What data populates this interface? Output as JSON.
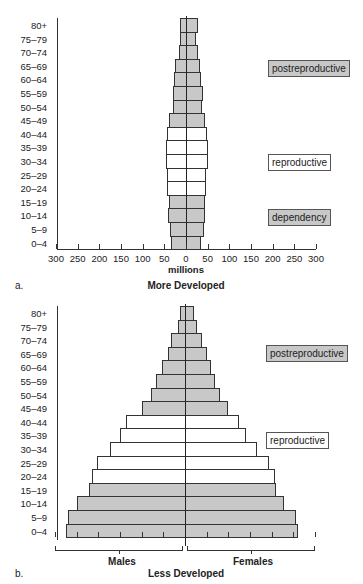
{
  "chart_data": [
    {
      "type": "bar",
      "subtype": "population-pyramid",
      "panel": "a.",
      "title": "More Developed",
      "xlabel": "millions",
      "ylabel": "",
      "xlim": [
        -300,
        300
      ],
      "x_tick_labels": [
        "300",
        "250",
        "200",
        "150",
        "100",
        "50",
        "0",
        "50",
        "100",
        "150",
        "200",
        "250",
        "300"
      ],
      "categories": [
        "80+",
        "75–79",
        "70–74",
        "65–69",
        "60–64",
        "55–59",
        "50–54",
        "45–49",
        "40–44",
        "35–39",
        "30–34",
        "25–29",
        "20–24",
        "15–19",
        "10–14",
        "5–9",
        "0–4"
      ],
      "series": [
        {
          "name": "Males",
          "side": "left",
          "values": [
            14,
            14,
            16,
            25,
            28,
            30,
            30,
            39,
            44,
            46,
            46,
            44,
            44,
            39,
            41,
            37,
            35
          ]
        },
        {
          "name": "Females",
          "side": "right",
          "values": [
            25,
            21,
            25,
            30,
            32,
            37,
            35,
            42,
            46,
            48,
            48,
            44,
            44,
            42,
            42,
            39,
            32
          ]
        }
      ],
      "group_shading": {
        "postreproductive": "gray",
        "reproductive": "white",
        "dependency": "gray"
      },
      "legend": [
        "postreproductive",
        "reproductive",
        "dependency"
      ],
      "legend_position": "right",
      "grid": false
    },
    {
      "type": "bar",
      "subtype": "population-pyramid",
      "panel": "b.",
      "title": "Less Developed",
      "xlabel_left": "Males",
      "xlabel_right": "Females",
      "xlim": [
        -300,
        300
      ],
      "categories": [
        "80+",
        "75–79",
        "70–74",
        "65–69",
        "60–64",
        "55–59",
        "50–54",
        "45–49",
        "40–44",
        "35–39",
        "30–34",
        "25–29",
        "20–24",
        "15–19",
        "10–14",
        "5–9",
        "0–4"
      ],
      "series": [
        {
          "name": "Males",
          "side": "left",
          "values": [
            12,
            16,
            32,
            39,
            53,
            67,
            78,
            99,
            136,
            150,
            173,
            203,
            215,
            222,
            249,
            270,
            275
          ]
        },
        {
          "name": "Females",
          "side": "right",
          "values": [
            18,
            25,
            37,
            48,
            58,
            67,
            78,
            97,
            122,
            138,
            164,
            192,
            205,
            208,
            226,
            254,
            258
          ]
        }
      ],
      "legend": [
        "postreproductive",
        "reproductive"
      ],
      "legend_position": "right",
      "grid": false
    }
  ],
  "age_groups": [
    "80+",
    "75–79",
    "70–74",
    "65–69",
    "60–64",
    "55–59",
    "50–54",
    "45–49",
    "40–44",
    "35–39",
    "30–34",
    "25–29",
    "20–24",
    "15–19",
    "10–14",
    "5–9",
    "0–4"
  ],
  "shading_by_age": [
    "gray",
    "gray",
    "gray",
    "gray",
    "gray",
    "gray",
    "gray",
    "gray",
    "white",
    "white",
    "white",
    "white",
    "white",
    "gray",
    "gray",
    "gray",
    "gray"
  ],
  "panel_a": {
    "letter": "a.",
    "title": "More Developed",
    "unit": "millions",
    "tick_labels": [
      "300",
      "250",
      "200",
      "150",
      "100",
      "50",
      "0",
      "50",
      "100",
      "150",
      "200",
      "250",
      "300"
    ],
    "legend": {
      "postreproductive": "postreproductive",
      "reproductive": "reproductive",
      "dependency": "dependency"
    }
  },
  "panel_b": {
    "letter": "b.",
    "title": "Less Developed",
    "males": "Males",
    "females": "Females",
    "legend": {
      "postreproductive": "postreproductive",
      "reproductive": "reproductive"
    }
  },
  "colors": {
    "gray_fill": "#c8c8c8",
    "white_fill": "#ffffff",
    "outline": "#333333"
  }
}
